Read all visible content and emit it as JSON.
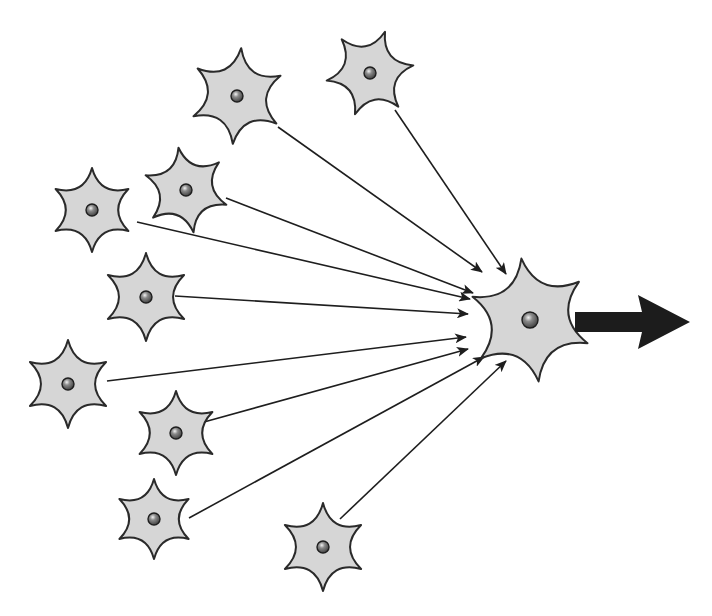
{
  "diagram": {
    "colors": {
      "cell_fill": "#d6d6d6",
      "cell_stroke": "#2a2a2a",
      "nucleus_fill": "#6a6a6a",
      "line": "#1e1e1e",
      "output_arrow": "#1c1c1c",
      "background": "#ffffff"
    },
    "target_neuron": {
      "id": "target",
      "cx": 530,
      "cy": 320,
      "r_outer": 62,
      "r_inner": 24,
      "rotation": -8,
      "points": 6,
      "nucleus_r": 8
    },
    "output_arrow": {
      "x1": 575,
      "x2": 690,
      "cy": 322,
      "shaft_height": 20,
      "head_length": 48,
      "head_height": 54
    },
    "input_neurons": [
      {
        "id": "n1",
        "cx": 237,
        "cy": 96,
        "r_outer": 48,
        "r_inner": 17,
        "rotation": 5,
        "points": 6,
        "nucleus_r": 6,
        "line": [
          278,
          127,
          482,
          272
        ]
      },
      {
        "id": "n2",
        "cx": 370,
        "cy": 73,
        "r_outer": 44,
        "r_inner": 16,
        "rotation": 20,
        "points": 6,
        "nucleus_r": 6,
        "line": [
          395,
          110,
          506,
          274
        ]
      },
      {
        "id": "n3",
        "cx": 186,
        "cy": 190,
        "r_outer": 43,
        "r_inner": 16,
        "rotation": -10,
        "points": 6,
        "nucleus_r": 6,
        "line": [
          226,
          198,
          473,
          293
        ]
      },
      {
        "id": "n4",
        "cx": 92,
        "cy": 210,
        "r_outer": 42,
        "r_inner": 16,
        "rotation": 0,
        "points": 6,
        "nucleus_r": 6,
        "line": [
          137,
          222,
          470,
          299
        ]
      },
      {
        "id": "n5",
        "cx": 146,
        "cy": 297,
        "r_outer": 44,
        "r_inner": 16,
        "rotation": 0,
        "points": 6,
        "nucleus_r": 6,
        "line": [
          175,
          296,
          468,
          314
        ]
      },
      {
        "id": "n6",
        "cx": 68,
        "cy": 384,
        "r_outer": 44,
        "r_inner": 16,
        "rotation": 0,
        "points": 6,
        "nucleus_r": 6,
        "line": [
          107,
          381,
          466,
          337
        ]
      },
      {
        "id": "n7",
        "cx": 176,
        "cy": 433,
        "r_outer": 42,
        "r_inner": 16,
        "rotation": 0,
        "points": 6,
        "nucleus_r": 6,
        "line": [
          204,
          422,
          468,
          349
        ]
      },
      {
        "id": "n8",
        "cx": 154,
        "cy": 519,
        "r_outer": 40,
        "r_inner": 15,
        "rotation": 0,
        "points": 6,
        "nucleus_r": 6,
        "line": [
          189,
          518,
          484,
          357
        ]
      },
      {
        "id": "n9",
        "cx": 323,
        "cy": 547,
        "r_outer": 44,
        "r_inner": 16,
        "rotation": 0,
        "points": 6,
        "nucleus_r": 6,
        "line": [
          340,
          519,
          506,
          361
        ]
      }
    ]
  }
}
